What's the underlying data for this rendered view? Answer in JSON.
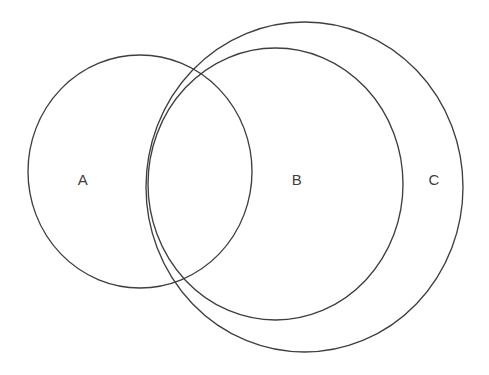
{
  "diagram": {
    "type": "venn",
    "title": "",
    "background_color": "#ffffff",
    "stroke_color": "#3f3f3f",
    "label_color": "#404040",
    "stroke_width": 1.35,
    "sets": [
      {
        "id": "A",
        "label": "A",
        "shape": "circle",
        "cx": 140,
        "cy": 171.5,
        "rx": 112,
        "ry": 116.5,
        "label_x": 83,
        "label_y": 181
      },
      {
        "id": "B",
        "label": "B",
        "shape": "circle",
        "cx": 275.5,
        "cy": 184,
        "rx": 127.5,
        "ry": 136,
        "label_x": 297,
        "label_y": 181
      },
      {
        "id": "C",
        "label": "C",
        "shape": "circle",
        "cx": 304.5,
        "cy": 187,
        "rx": 158.5,
        "ry": 165,
        "label_x": 434,
        "label_y": 181
      }
    ],
    "relations": [
      "A overlaps B",
      "A overlaps C",
      "B is contained within C"
    ]
  }
}
